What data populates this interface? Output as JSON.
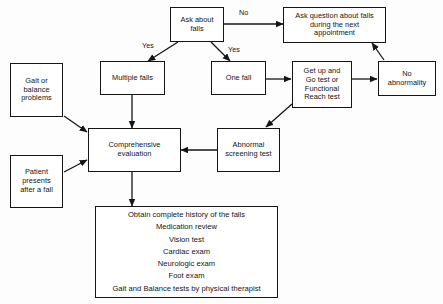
{
  "diagram": {
    "background_color": "#fdfdfd",
    "line_color": "#151515",
    "text_color": "#141414"
  },
  "nodes": {
    "ask_about_falls": "Ask about\nfalls",
    "ask_question_next_appointment": "Ask question about falls\nduring the next\nappointment",
    "multiple_falls": "Multiple falls",
    "one_fall": "One fall",
    "get_up_and_go": "Get up and\nGo test or\nFunctional\nReach test",
    "no_abnormality": "No\nabnormality",
    "gait_or_balance_problems": "Gait or\nbalance\nproblems",
    "patient_presents_after_fall": "Patient\npresents\nafter a fall",
    "comprehensive_evaluation": "Comprehensive\nevaluation",
    "abnormal_screening_test": "Abnormal\nscreening test",
    "workup_list": "Obtain complete history of the falls\nMedication review\nVision test\nCardiac exam\nNeurologic exam\nFoot exam\nGait and Balance tests by physical therapist"
  },
  "edge_labels": {
    "no": "No",
    "yes_left": "Yes",
    "yes_right": "Yes"
  },
  "workup_items": [
    "Obtain complete history of the falls",
    "Medication review",
    "Vision test",
    "Cardiac exam",
    "Neurologic exam",
    "Foot exam",
    "Gait and Balance tests by physical therapist"
  ]
}
